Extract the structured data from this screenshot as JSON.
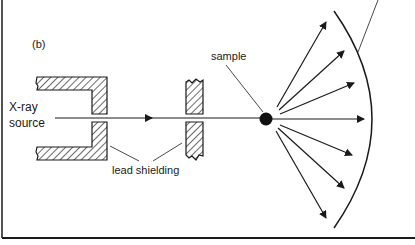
{
  "figure": {
    "panel_label": "(b)",
    "labels": {
      "source_line1": "X-ray",
      "source_line2": "source",
      "sample": "sample",
      "shielding": "lead shielding"
    },
    "colors": {
      "ink": "#1a1a1a",
      "background": "#ffffff"
    },
    "scattered_rays": 7,
    "components": [
      "X-ray source",
      "lead shielding (collimator)",
      "lead shielding (aperture)",
      "sample",
      "detector (curved film)"
    ]
  }
}
